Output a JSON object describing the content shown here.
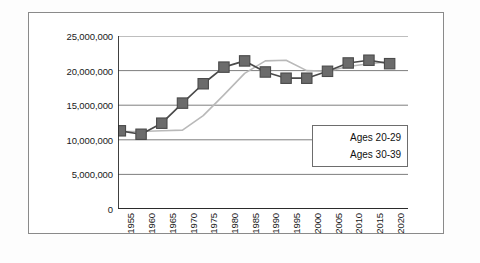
{
  "chart_data": {
    "type": "line",
    "title": "",
    "xlabel": "",
    "ylabel": "",
    "grid": true,
    "legend_position": "inside-right",
    "categories": [
      "1955",
      "1960",
      "1965",
      "1970",
      "1975",
      "1980",
      "1985",
      "1990",
      "1995",
      "2000",
      "2005",
      "2010",
      "2015",
      "2020"
    ],
    "ylim": [
      0,
      25000000
    ],
    "ytick_values": [
      0,
      5000000,
      10000000,
      15000000,
      20000000,
      25000000
    ],
    "ytick_labels": [
      "0",
      "5,000,000",
      "10,000,000",
      "15,000,000",
      "20,000,000",
      "25,000,000"
    ],
    "series": [
      {
        "name": "Ages 20-29",
        "color": "#6b6b6b",
        "marker": "square",
        "values": [
          11300000,
          10800000,
          12400000,
          15300000,
          18100000,
          20500000,
          21400000,
          19800000,
          18900000,
          18900000,
          19900000,
          21100000,
          21500000,
          21000000
        ]
      },
      {
        "name": "Ages 30-39",
        "color": "#b9b9b9",
        "marker": "none",
        "values": [
          11200000,
          11200000,
          11300000,
          11400000,
          13500000,
          16500000,
          19600000,
          21400000,
          21500000,
          20000000,
          19900000,
          20600000,
          21000000,
          21300000
        ]
      }
    ]
  },
  "legend": {
    "items": [
      {
        "label": "Ages 20-29"
      },
      {
        "label": "Ages 30-39"
      }
    ]
  },
  "colors": {
    "series_1": "#6b6b6b",
    "series_2": "#b9b9b9",
    "axis": "#2b2b2b",
    "grid": "#6f6f6f",
    "frame": "#8a8a8a"
  },
  "caption": ""
}
